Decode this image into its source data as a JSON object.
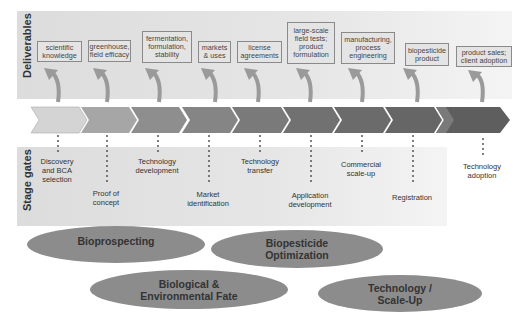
{
  "bands": {
    "deliverables_label": "Deliverables",
    "stage_gates_label": "Stage gates"
  },
  "deliverables": [
    {
      "label": "scientific knowledge"
    },
    {
      "label": "greenhouse, field efficacy"
    },
    {
      "label": "fermentation, formulation, stability"
    },
    {
      "label": "markets & uses"
    },
    {
      "label": "license agreements"
    },
    {
      "label": "large-scale field tests; product formulation"
    },
    {
      "label": "manufacturing, process engineering"
    },
    {
      "label": "biopesticide product"
    },
    {
      "label": "product sales; client adoption"
    }
  ],
  "chevrons": {
    "count": 9,
    "colors": [
      "#d4d4d4",
      "#a6a6a6",
      "#8e8e8e",
      "#858585",
      "#7a7a7a",
      "#717171",
      "#6b6b6b",
      "#666666",
      "#5e5e5e"
    ]
  },
  "stage_gates": [
    {
      "label": "Discovery and BCA selection"
    },
    {
      "label": "Proof of concept"
    },
    {
      "label": "Technology development"
    },
    {
      "label": "Market identification"
    },
    {
      "label": "Technology transfer"
    },
    {
      "label": "Application development"
    },
    {
      "label": "Commercial scale-up"
    },
    {
      "label": "Registration"
    },
    {
      "label": "Technology adoption"
    }
  ],
  "themes": [
    {
      "label": "Bioprospecting"
    },
    {
      "label": "Biopesticide Optimization"
    },
    {
      "label": "Biological & Environmental Fate"
    },
    {
      "label": "Technology / Scale-Up"
    }
  ]
}
